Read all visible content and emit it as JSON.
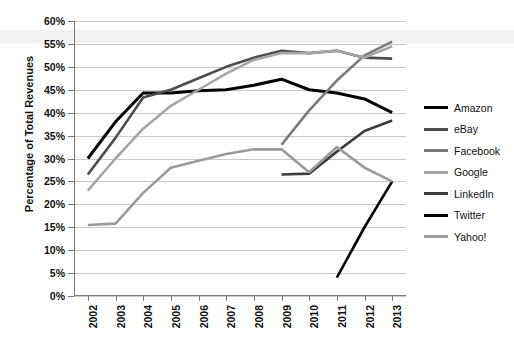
{
  "chart_data": {
    "type": "line",
    "title": "",
    "subtitle": "",
    "xlabel": "",
    "ylabel": "Percentage of Total Revenues",
    "x": [
      "2002",
      "2003",
      "2004",
      "2005",
      "2006",
      "2007",
      "2008",
      "2009",
      "2010",
      "2011",
      "2012",
      "2013"
    ],
    "categories": [
      "2002",
      "2003",
      "2004",
      "2005",
      "2006",
      "2007",
      "2008",
      "2009",
      "2010",
      "2011",
      "2012",
      "2013"
    ],
    "ylim": [
      0,
      60
    ],
    "ytick_step": 5,
    "ytick_labels": [
      "0%",
      "5%",
      "10%",
      "15%",
      "20%",
      "25%",
      "30%",
      "35%",
      "40%",
      "45%",
      "50%",
      "55%",
      "60%"
    ],
    "ytick_values": [
      0,
      5,
      10,
      15,
      20,
      25,
      30,
      35,
      40,
      45,
      50,
      55,
      60
    ],
    "grid": "horizontal",
    "legend_position": "right",
    "value_unit": "%",
    "series": [
      {
        "name": "Amazon",
        "color": "#000000",
        "width": 3.0,
        "values": [
          30.0,
          38.0,
          44.3,
          44.3,
          44.8,
          45.0,
          46.0,
          47.3,
          45.0,
          44.3,
          43.0,
          40.0
        ]
      },
      {
        "name": "eBay",
        "color": "#4d4d4d",
        "width": 2.6,
        "values": [
          26.5,
          34.5,
          43.3,
          45.0,
          47.5,
          50.0,
          52.0,
          53.5,
          53.0,
          53.5,
          52.0,
          51.8
        ]
      },
      {
        "name": "Facebook",
        "color": "#7a7a7a",
        "width": 2.6,
        "values": [
          null,
          null,
          null,
          null,
          null,
          null,
          null,
          33.0,
          40.5,
          47.0,
          52.5,
          55.5
        ]
      },
      {
        "name": "Google",
        "color": "#a6a6a6",
        "width": 2.6,
        "values": [
          23.0,
          30.0,
          36.5,
          41.5,
          45.0,
          48.5,
          51.5,
          53.0,
          53.0,
          53.5,
          52.0,
          54.5
        ]
      },
      {
        "name": "LinkedIn",
        "color": "#3d3d3d",
        "width": 2.6,
        "values": [
          null,
          null,
          null,
          null,
          null,
          null,
          null,
          26.5,
          26.7,
          31.5,
          36.0,
          38.3
        ]
      },
      {
        "name": "Twitter",
        "color": "#000000",
        "width": 2.6,
        "values": [
          null,
          null,
          null,
          null,
          null,
          null,
          null,
          null,
          null,
          4.0,
          15.0,
          25.0
        ]
      },
      {
        "name": "Yahoo!",
        "color": "#9a9a9a",
        "width": 2.6,
        "values": [
          15.5,
          15.8,
          22.5,
          28.0,
          29.5,
          31.0,
          32.0,
          32.0,
          27.0,
          32.5,
          28.0,
          25.0
        ]
      }
    ]
  },
  "legend": {
    "items": [
      {
        "label": "Amazon",
        "color": "#000000"
      },
      {
        "label": "eBay",
        "color": "#4d4d4d"
      },
      {
        "label": "Facebook",
        "color": "#7a7a7a"
      },
      {
        "label": "Google",
        "color": "#a6a6a6"
      },
      {
        "label": "LinkedIn",
        "color": "#3d3d3d"
      },
      {
        "label": "Twitter",
        "color": "#000000"
      },
      {
        "label": "Yahoo!",
        "color": "#9a9a9a"
      }
    ]
  },
  "axes": {
    "y_title": "Percentage of Total Revenues"
  }
}
